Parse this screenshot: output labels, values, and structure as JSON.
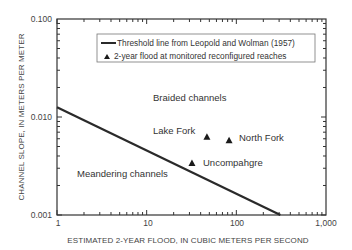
{
  "chart_data": {
    "type": "scatter",
    "title": "",
    "xlabel": "ESTIMATED 2-YEAR FLOOD, IN CUBIC METERS PER SECOND",
    "ylabel": "CHANNEL SLOPE, IN METERS PER METER",
    "xscale": "log",
    "yscale": "log",
    "xlim": [
      1,
      1000
    ],
    "ylim": [
      0.001,
      0.1
    ],
    "x_ticks": [
      1,
      10,
      100,
      1000
    ],
    "x_tick_labels": [
      "1",
      "10",
      "100",
      "1,000"
    ],
    "y_ticks": [
      0.001,
      0.01,
      0.1
    ],
    "y_tick_labels": [
      "0.001",
      "0.010",
      "0.100"
    ],
    "grid": false,
    "legend_position": "upper right inside",
    "series": [
      {
        "name": "Threshold line from Leopold and Wolman (1957)",
        "type": "line",
        "color": "#2a2a2a",
        "x": [
          1,
          310
        ],
        "y": [
          0.0126,
          0.001
        ]
      },
      {
        "name": "2-year flood at monitored reconfigured reaches",
        "type": "scatter",
        "marker": "triangle",
        "color": "#1a1a1a",
        "points": [
          {
            "label": "Lake Fork",
            "x": 47,
            "y": 0.0063
          },
          {
            "label": "North Fork",
            "x": 83,
            "y": 0.0058
          },
          {
            "label": "Uncompahgre",
            "x": 32,
            "y": 0.0034
          }
        ]
      }
    ],
    "annotations": [
      {
        "text": "Braided channels",
        "x": 60,
        "y": 0.016
      },
      {
        "text": "Meandering channels",
        "x": 6.5,
        "y": 0.0024
      },
      {
        "text": "Lake Fork",
        "x": 26,
        "y": 0.0073
      },
      {
        "text": "North Fork",
        "x": 150,
        "y": 0.0065
      },
      {
        "text": "Uncompahgre",
        "x": 90,
        "y": 0.0037
      }
    ]
  },
  "legend": {
    "items": [
      {
        "label": "Threshold line from Leopold and Wolman (1957)",
        "symbol": "line"
      },
      {
        "label": "2-year flood at monitored reconfigured reaches",
        "symbol": "triangle"
      }
    ]
  },
  "labels": {
    "braided": "Braided channels",
    "meandering": "Meandering channels",
    "lake_fork": "Lake Fork",
    "north_fork": "North Fork",
    "uncompahgre": "Uncompahgre"
  },
  "axes": {
    "x_title": "ESTIMATED 2-YEAR FLOOD, IN CUBIC METERS PER SECOND",
    "y_title": "CHANNEL SLOPE, IN METERS PER METER",
    "x_ticks": [
      "1",
      "10",
      "100",
      "1,000"
    ],
    "y_ticks": [
      "0.100",
      "0.010",
      "0.001"
    ]
  },
  "colors": {
    "frame": "#333333",
    "line": "#2a2a2a",
    "marker": "#1a1a1a",
    "text": "#333333",
    "legend_border": "#777777"
  }
}
